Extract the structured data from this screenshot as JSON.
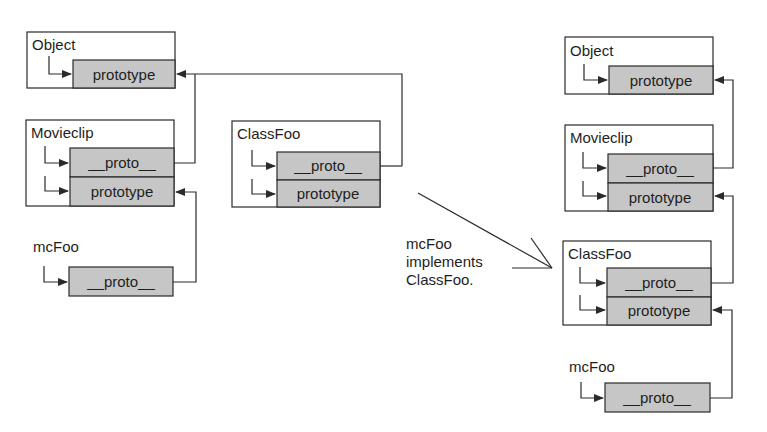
{
  "diagram": {
    "left": {
      "object": {
        "title": "Object",
        "cells": [
          "prototype"
        ]
      },
      "movieclip": {
        "title": "Movieclip",
        "cells": [
          "__proto__",
          "prototype"
        ]
      },
      "classfoo": {
        "title": "ClassFoo",
        "cells": [
          "__proto__",
          "prototype"
        ]
      },
      "mcfoo": {
        "title": "mcFoo",
        "cells": [
          "__proto__"
        ]
      }
    },
    "transition_note": {
      "lines": [
        "mcFoo",
        "implements",
        "ClassFoo."
      ]
    },
    "right": {
      "object": {
        "title": "Object",
        "cells": [
          "prototype"
        ]
      },
      "movieclip": {
        "title": "Movieclip",
        "cells": [
          "__proto__",
          "prototype"
        ]
      },
      "classfoo": {
        "title": "ClassFoo",
        "cells": [
          "__proto__",
          "prototype"
        ]
      },
      "mcfoo": {
        "title": "mcFoo",
        "cells": [
          "__proto__"
        ]
      }
    },
    "colors": {
      "cell_fill": "#c6c6c6",
      "stroke": "#2a2a2a",
      "background": "#ffffff"
    }
  }
}
